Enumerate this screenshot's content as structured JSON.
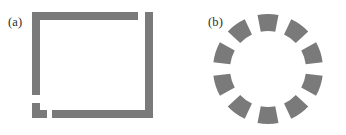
{
  "figure": {
    "background_color": "#ffffff",
    "ink_color": "#7a7a7a",
    "label_color": "#2b2b2b",
    "panels": [
      {
        "id": "a",
        "label": "(a)",
        "type": "broken-square",
        "description": "Square outline drawn with thick bars and deliberate gaps at corners",
        "stroke_width": 8,
        "bars": [
          {
            "name": "top-bar",
            "x": 32,
            "y": 12,
            "w": 106,
            "h": 8
          },
          {
            "name": "left-bar",
            "x": 32,
            "y": 12,
            "w": 8,
            "h": 83
          },
          {
            "name": "right-bar",
            "x": 145,
            "y": 12,
            "w": 8,
            "h": 106
          },
          {
            "name": "bottom-bar",
            "x": 52,
            "y": 110,
            "w": 101,
            "h": 8
          },
          {
            "name": "corner-fragment-v",
            "x": 32,
            "y": 103,
            "w": 8,
            "h": 15
          },
          {
            "name": "corner-fragment-h",
            "x": 32,
            "y": 110,
            "w": 15,
            "h": 8
          }
        ]
      },
      {
        "id": "b",
        "label": "(b)",
        "type": "segmented-ring",
        "description": "Ring of ten evenly spaced annular sector segments",
        "segment_count": 10,
        "segment_angular_width_deg": 22,
        "segment_gap_deg": 14,
        "inner_radius": 38,
        "outer_radius": 55,
        "center_x": 59,
        "center_y": 59,
        "start_angle_deg": -90,
        "segment_angles_deg": [
          -90,
          -54,
          -18,
          18,
          54,
          90,
          126,
          162,
          198,
          234
        ]
      }
    ]
  }
}
